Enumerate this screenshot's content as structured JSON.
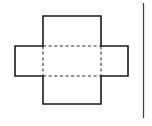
{
  "figure": {
    "canvas": {
      "width": 152,
      "height": 126,
      "background": "#ffffff"
    },
    "style": {
      "solid_stroke": "#1a1a1a",
      "dashed_stroke": "#333333",
      "rule_stroke": "#444444",
      "solid_width": 1.6,
      "dashed_width": 1.1,
      "rule_width": 1.3,
      "dash_pattern": "3.2 2.4",
      "fill": "none"
    },
    "geometry": {
      "center_face": {
        "label": "center-face",
        "x": 43,
        "y": 46,
        "width": 58,
        "height": 30
      },
      "top_flap": {
        "label": "top-flap",
        "x": 43,
        "y": 16,
        "width": 58,
        "height": 30
      },
      "bottom_flap": {
        "label": "bottom-flap",
        "x": 43,
        "y": 76,
        "width": 58,
        "height": 28
      },
      "left_flap": {
        "label": "left-flap",
        "x": 15,
        "y": 46,
        "width": 28,
        "height": 30
      },
      "right_flap": {
        "label": "right-flap",
        "x": 101,
        "y": 46,
        "width": 27,
        "height": 30
      }
    },
    "outline_path": "M43,16 L101,16 L101,46 L128,46 L128,76 L101,76 L101,104 L43,104 L43,76 L15,76 L15,46 L43,46 Z",
    "fold_lines": [
      {
        "name": "fold-line-top",
        "x1": 43,
        "y1": 46,
        "x2": 101,
        "y2": 46
      },
      {
        "name": "fold-line-bottom",
        "x1": 43,
        "y1": 76,
        "x2": 101,
        "y2": 76
      },
      {
        "name": "fold-line-left",
        "x1": 43,
        "y1": 46,
        "x2": 43,
        "y2": 76
      },
      {
        "name": "fold-line-right",
        "x1": 101,
        "y1": 46,
        "x2": 101,
        "y2": 76
      }
    ],
    "vertical_rule": {
      "name": "vertical-rule",
      "x1": 143.5,
      "y1": 3,
      "x2": 143.5,
      "y2": 118
    }
  }
}
